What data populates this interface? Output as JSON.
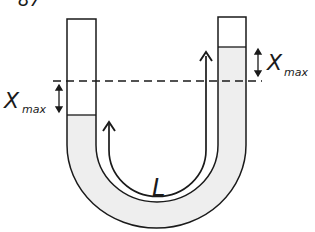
{
  "figure": {
    "cropped_header_fragment": "87",
    "labels": {
      "left_x": "X",
      "left_sub": "max",
      "right_x": "X",
      "right_sub": "max",
      "length": "L"
    },
    "colors": {
      "stroke": "#1a1a1a",
      "liquid_fill": "#eeeeee",
      "background": "#ffffff"
    }
  }
}
